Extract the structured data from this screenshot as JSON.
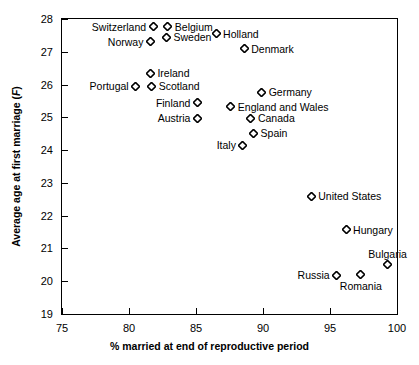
{
  "chart_data": {
    "type": "scatter",
    "title": "",
    "xlabel": "% married at end of reproductive period",
    "ylabel": "Average age at first marriage (F)",
    "ylabel_parts": {
      "text": "Average age at first marriage (",
      "italic": "F",
      "tail": ")"
    },
    "xlim": [
      75,
      100
    ],
    "ylim": [
      19,
      28
    ],
    "xticks": [
      75,
      80,
      85,
      90,
      95,
      100
    ],
    "yticks": [
      19,
      20,
      21,
      22,
      23,
      24,
      25,
      26,
      27,
      28
    ],
    "grid": false,
    "legend": "none",
    "marker": "open-diamond",
    "points": [
      {
        "label": "Switzerland",
        "x": 81.8,
        "y": 27.76,
        "side": "left"
      },
      {
        "label": "Belgium",
        "x": 82.9,
        "y": 27.76,
        "side": "right"
      },
      {
        "label": "Norway",
        "x": 81.6,
        "y": 27.3,
        "side": "left"
      },
      {
        "label": "Sweden",
        "x": 82.8,
        "y": 27.45,
        "side": "right"
      },
      {
        "label": "Holland",
        "x": 86.5,
        "y": 27.55,
        "side": "right"
      },
      {
        "label": "Denmark",
        "x": 88.6,
        "y": 27.1,
        "side": "right"
      },
      {
        "label": "Ireland",
        "x": 81.6,
        "y": 26.35,
        "side": "right"
      },
      {
        "label": "Portugal",
        "x": 80.5,
        "y": 25.95,
        "side": "left"
      },
      {
        "label": "Scotland",
        "x": 81.7,
        "y": 25.95,
        "side": "right"
      },
      {
        "label": "Finland",
        "x": 85.1,
        "y": 25.45,
        "side": "left"
      },
      {
        "label": "Austria",
        "x": 85.1,
        "y": 24.97,
        "side": "left"
      },
      {
        "label": "Germany",
        "x": 89.9,
        "y": 25.76,
        "side": "right"
      },
      {
        "label": "England and Wales",
        "x": 87.6,
        "y": 25.33,
        "side": "right"
      },
      {
        "label": "Canada",
        "x": 89.1,
        "y": 24.97,
        "side": "right"
      },
      {
        "label": "Spain",
        "x": 89.3,
        "y": 24.52,
        "side": "right"
      },
      {
        "label": "Italy",
        "x": 88.5,
        "y": 24.15,
        "side": "left"
      },
      {
        "label": "United States",
        "x": 93.6,
        "y": 22.6,
        "side": "right"
      },
      {
        "label": "Hungary",
        "x": 96.2,
        "y": 21.57,
        "side": "right"
      },
      {
        "label": "Bulgaria",
        "x": 99.3,
        "y": 20.5,
        "side": "above"
      },
      {
        "label": "Russia",
        "x": 95.5,
        "y": 20.18,
        "side": "left"
      },
      {
        "label": "Romania",
        "x": 97.3,
        "y": 20.2,
        "side": "below"
      }
    ]
  },
  "colors": {
    "axis": "#000000",
    "text": "#000000",
    "marker_stroke": "#000000",
    "background": "#ffffff"
  }
}
